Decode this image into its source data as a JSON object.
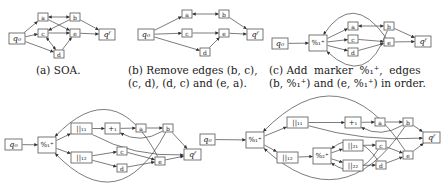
{
  "captions": {
    "a": "(a) SOA.",
    "b_line1": "(b) Remove edges (b, c),",
    "b_line2": "(c, d), (d, c) and (e, a).",
    "c_line1": "(c) Add  marker  %₁⁺,  edges",
    "c_line2": "(b, %₁⁺) and (e, %₁⁺) in order."
  },
  "labels": {
    "q0": "q₀",
    "qf": "qᶠ",
    "a": "a",
    "b": "b",
    "c": "c",
    "d": "d",
    "e": "e",
    "m1": "%₁⁺",
    "m2": "%₂⁺",
    "p1": "+₁",
    "par11": "||₁₁",
    "par12": "||₁₂",
    "par21": "||₂₁",
    "par22": "||₂₂"
  },
  "graphs": [
    {
      "id": "a",
      "edges": [
        [
          "q0",
          "a"
        ],
        [
          "q0",
          "c"
        ],
        [
          "q0",
          "d"
        ],
        [
          "a",
          "b"
        ],
        [
          "b",
          "a"
        ],
        [
          "b",
          "c"
        ],
        [
          "a",
          "e"
        ],
        [
          "c",
          "e"
        ],
        [
          "c",
          "d"
        ],
        [
          "d",
          "c"
        ],
        [
          "d",
          "e"
        ],
        [
          "b",
          "qf"
        ],
        [
          "e",
          "qf"
        ]
      ]
    },
    {
      "id": "b",
      "edges": [
        [
          "q0",
          "a"
        ],
        [
          "q0",
          "c"
        ],
        [
          "q0",
          "d"
        ],
        [
          "a",
          "b"
        ],
        [
          "b",
          "a"
        ],
        [
          "c",
          "e"
        ],
        [
          "d",
          "e"
        ],
        [
          "b",
          "qf"
        ],
        [
          "e",
          "qf"
        ]
      ]
    },
    {
      "id": "c",
      "edges": [
        [
          "q0",
          "m1"
        ],
        [
          "m1",
          "a"
        ],
        [
          "m1",
          "c"
        ],
        [
          "m1",
          "d"
        ],
        [
          "a",
          "b"
        ],
        [
          "b",
          "a"
        ],
        [
          "c",
          "e"
        ],
        [
          "d",
          "e"
        ],
        [
          "b",
          "qf"
        ],
        [
          "e",
          "qf"
        ],
        [
          "b",
          "m1"
        ],
        [
          "e",
          "m1"
        ]
      ]
    },
    {
      "id": "d",
      "edges": [
        [
          "q0",
          "m1"
        ],
        [
          "m1",
          "par11"
        ],
        [
          "m1",
          "par12"
        ],
        [
          "par11",
          "p1"
        ],
        [
          "p1",
          "a"
        ],
        [
          "a",
          "b"
        ],
        [
          "b",
          "p1"
        ],
        [
          "par11",
          "qf"
        ],
        [
          "b",
          "qf"
        ],
        [
          "par12",
          "c"
        ],
        [
          "par12",
          "d"
        ],
        [
          "c",
          "e"
        ],
        [
          "d",
          "e"
        ],
        [
          "e",
          "qf"
        ],
        [
          "b",
          "m1"
        ],
        [
          "e",
          "m1"
        ]
      ]
    },
    {
      "id": "e",
      "edges": [
        [
          "q0",
          "m1"
        ],
        [
          "m1",
          "par11"
        ],
        [
          "m1",
          "par12"
        ],
        [
          "par11",
          "p1"
        ],
        [
          "p1",
          "a"
        ],
        [
          "a",
          "b"
        ],
        [
          "b",
          "p1"
        ],
        [
          "par11",
          "qf"
        ],
        [
          "b",
          "qf"
        ],
        [
          "par12",
          "m2"
        ],
        [
          "m2",
          "par21"
        ],
        [
          "m2",
          "par22"
        ],
        [
          "par21",
          "c"
        ],
        [
          "par22",
          "d"
        ],
        [
          "c",
          "e"
        ],
        [
          "d",
          "e"
        ],
        [
          "c",
          "m2"
        ],
        [
          "d",
          "m2"
        ],
        [
          "e",
          "qf"
        ],
        [
          "b",
          "m1"
        ],
        [
          "e",
          "m1"
        ]
      ]
    }
  ]
}
